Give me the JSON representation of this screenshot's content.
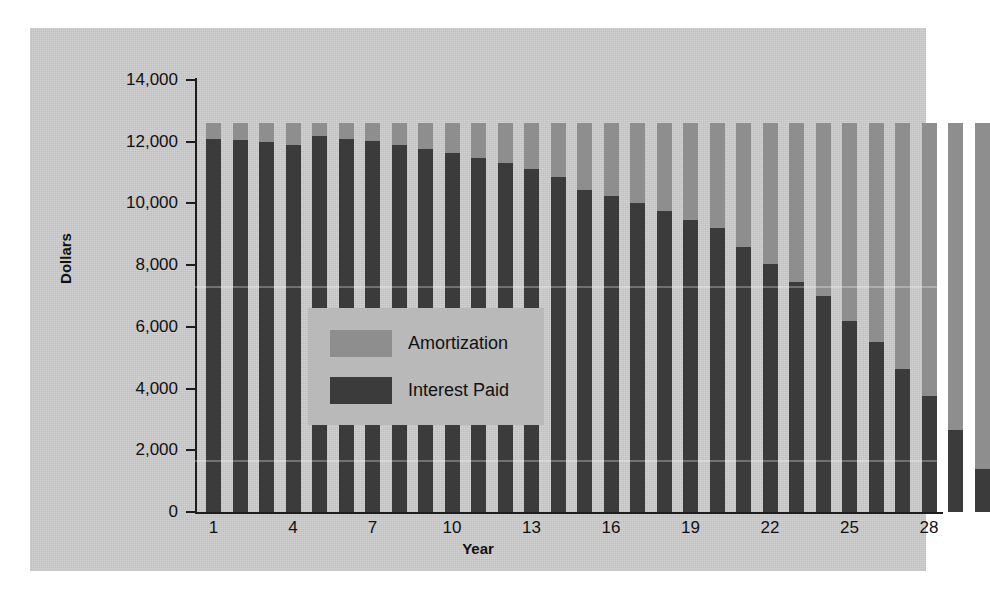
{
  "chart_data": {
    "type": "bar",
    "barmode": "stacked",
    "title": "",
    "xlabel": "Year",
    "ylabel": "Dollars",
    "ylim": [
      0,
      14000
    ],
    "ytick_values": [
      0,
      2000,
      4000,
      6000,
      8000,
      10000,
      12000,
      14000
    ],
    "ytick_labels": [
      "0",
      "2,000",
      "4,000",
      "6,000",
      "8,000",
      "10,000",
      "12,000",
      "14,000"
    ],
    "xtick_values": [
      1,
      4,
      7,
      10,
      13,
      16,
      19,
      22,
      25,
      28
    ],
    "xtick_labels": [
      "1",
      "4",
      "7",
      "10",
      "13",
      "16",
      "19",
      "22",
      "25",
      "28"
    ],
    "grid": false,
    "legend_position": "center-left-inside",
    "categories": [
      1,
      2,
      3,
      4,
      5,
      6,
      7,
      8,
      9,
      10,
      11,
      12,
      13,
      14,
      15,
      16,
      17,
      18,
      19,
      20,
      21,
      22,
      23,
      24,
      25,
      26,
      27,
      28,
      29,
      30
    ],
    "series": [
      {
        "name": "Interest Paid",
        "color": "#3b3b3b",
        "values": [
          12100,
          12050,
          11980,
          11880,
          12180,
          12100,
          12010,
          11900,
          11780,
          11640,
          11480,
          11300,
          11100,
          10870,
          10450,
          10250,
          10000,
          9750,
          9450,
          9200,
          8600,
          8050,
          7450,
          7000,
          6200,
          5500,
          4650,
          3750,
          2650,
          1400
        ]
      },
      {
        "name": "Amortization",
        "color": "#8e8e8e",
        "values": [
          500,
          550,
          620,
          720,
          420,
          500,
          590,
          700,
          820,
          960,
          1120,
          1300,
          1500,
          1730,
          2150,
          2350,
          2600,
          2850,
          3150,
          3400,
          4000,
          4550,
          5150,
          5600,
          6400,
          7100,
          7950,
          8850,
          9950,
          11200
        ]
      }
    ],
    "series_totals": [
      12600,
      12600,
      12600,
      12600,
      12600,
      12600,
      12600,
      12600,
      12600,
      12600,
      12600,
      12600,
      12600,
      12600,
      12600,
      12600,
      12600,
      12600,
      12600,
      12600,
      12600,
      12600,
      12600,
      12600,
      12600,
      12600,
      12600,
      12600,
      12600,
      12600
    ],
    "note": "Stacked bars of constant annual payment ~12,600; interest declines and amortization (principal) rises across 30 years."
  },
  "legend": {
    "items": [
      {
        "label": "Amortization",
        "color": "#8e8e8e"
      },
      {
        "label": "Interest Paid",
        "color": "#3b3b3b"
      }
    ]
  },
  "colors": {
    "plate_background": "#cdcdcd",
    "legend_background": "#b9b9b9",
    "axis": "#1d1d1d",
    "amortization": "#8e8e8e",
    "interest": "#3b3b3b"
  }
}
